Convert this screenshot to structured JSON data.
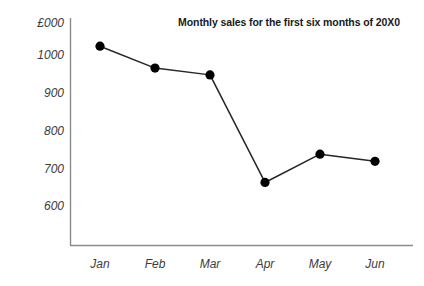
{
  "chart_data": {
    "type": "line",
    "title": "Monthly sales for the first six months of 20X0",
    "xlabel": "",
    "ylabel": "£000",
    "categories": [
      "Jan",
      "Feb",
      "Mar",
      "Apr",
      "May",
      "Jun"
    ],
    "values": [
      1026,
      968,
      950,
      665,
      740,
      721
    ],
    "series": [
      {
        "name": "Monthly sales",
        "values": [
          1026,
          968,
          950,
          665,
          740,
          721
        ]
      }
    ],
    "ytick_labels": [
      "1000",
      "900",
      "800",
      "700",
      "600"
    ],
    "ytick_values": [
      1000,
      900,
      800,
      700,
      600
    ],
    "ylim": [
      560,
      1060
    ],
    "y_axis_unit_label": "£000",
    "grid": false,
    "legend": false,
    "legend_position": "none",
    "marker": "filled-circle",
    "line_color": "#262626",
    "marker_color": "#000000",
    "axis_color": "#7f7f7f",
    "background_color": "#ffffff",
    "text_color": "#3c3c3c",
    "title_color": "#1a1a1a"
  },
  "axes": {
    "y_labels": [
      {
        "text": "£000",
        "y": 24
      },
      {
        "text": "1000",
        "y": 56
      },
      {
        "text": "900",
        "y": 94
      },
      {
        "text": "800",
        "y": 132
      },
      {
        "text": "700",
        "y": 170
      },
      {
        "text": "600",
        "y": 207
      }
    ],
    "x_labels": [
      {
        "text": "Jan",
        "x": 100
      },
      {
        "text": "Feb",
        "x": 155
      },
      {
        "text": "Mar",
        "x": 210
      },
      {
        "text": "Apr",
        "x": 265
      },
      {
        "text": "May",
        "x": 320
      },
      {
        "text": "Jun",
        "x": 375
      }
    ]
  }
}
